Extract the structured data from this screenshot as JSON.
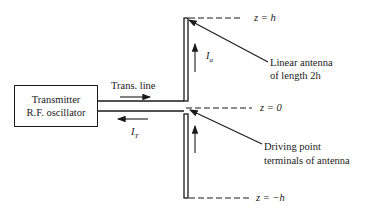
{
  "diagram": {
    "type": "dipole-antenna-schematic",
    "source_block": {
      "line1": "Transmitter",
      "line2": "R.F. oscillator"
    },
    "transmission_line": {
      "label": "Trans. line",
      "current_label": "I",
      "current_subscript": "T"
    },
    "antenna": {
      "current_label": "I",
      "current_subscript": "a",
      "callout_top": {
        "line1": "Linear antenna",
        "line2": "of length 2h"
      },
      "callout_feed": {
        "line1": "Driving point",
        "line2": "terminals of antenna"
      }
    },
    "levels": {
      "top": "z = h",
      "middle": "z = 0",
      "bottom": "z = −h"
    }
  }
}
